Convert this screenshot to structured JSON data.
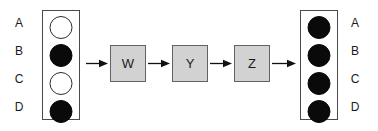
{
  "diagram": {
    "type": "process-flow",
    "title": "",
    "colors": {
      "filled_circle": "#0a0a0a",
      "open_circle": "#ffffff",
      "circle_stroke": "#2b2b2b",
      "box_fill": "#d2d2d2",
      "box_stroke": "#636363",
      "panel_stroke": "#4a4a4a",
      "arrow": "#111111",
      "text": "#1a1a1a",
      "background": "#ffffff"
    }
  },
  "input_panel": {
    "name": "input-panel",
    "labels_side": "left",
    "rows": [
      {
        "label": "A",
        "state": "open"
      },
      {
        "label": "B",
        "state": "filled"
      },
      {
        "label": "C",
        "state": "open"
      },
      {
        "label": "D",
        "state": "filled"
      }
    ]
  },
  "process_boxes": [
    {
      "label": "W"
    },
    {
      "label": "Y"
    },
    {
      "label": "Z"
    }
  ],
  "output_panel": {
    "name": "output-panel",
    "labels_side": "right",
    "rows": [
      {
        "label": "A",
        "state": "filled"
      },
      {
        "label": "B",
        "state": "filled"
      },
      {
        "label": "C",
        "state": "filled"
      },
      {
        "label": "D",
        "state": "filled"
      }
    ]
  },
  "arrows": [
    {
      "from": "input-panel",
      "to": "W"
    },
    {
      "from": "W",
      "to": "Y"
    },
    {
      "from": "Y",
      "to": "Z"
    },
    {
      "from": "Z",
      "to": "output-panel"
    }
  ]
}
